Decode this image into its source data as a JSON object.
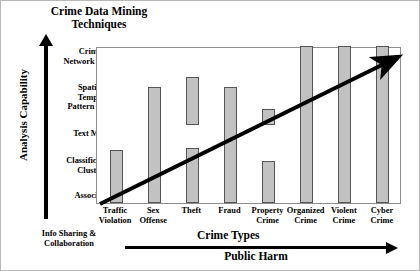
{
  "chart_data": {
    "type": "bar",
    "title": "Crime Data Mining Techniques",
    "title_line1": "Crime Data Mining",
    "title_line2": "Techniques",
    "xlabel": "Crime Types",
    "ylabel": "Analysis Capability",
    "secondary_xlabel": "Public Harm",
    "bottom_left_label": "Info Sharing & Collaboration",
    "grid": false,
    "legend": "none",
    "ylim": [
      0,
      5
    ],
    "ytick_labels": [
      "Association",
      "Classification & Clusterng",
      "Text Mining",
      "Spatial & Temporal Pattern Mining",
      "Criminal Network Analysis"
    ],
    "categories": [
      "Traffic Violation",
      "Sex Offense",
      "Theft",
      "Fraud",
      "Property Crime",
      "Organized Crime",
      "Violent Crime",
      "Cyber Crime"
    ],
    "values": [
      1.7,
      3.7,
      4.0,
      3.7,
      3.0,
      5.0,
      5.0,
      5.0
    ],
    "annotation": "Diagonal trend arrow rising from lower-left to upper-right",
    "bars": [
      {
        "label_line1": "Traffic",
        "label_line2": "Violation",
        "segments": [
          {
            "from": 0.0,
            "to": 1.7
          }
        ]
      },
      {
        "label_line1": "Sex",
        "label_line2": "Offense",
        "segments": [
          {
            "from": 0.0,
            "to": 3.7
          }
        ]
      },
      {
        "label_line1": "Theft",
        "label_line2": "",
        "segments": [
          {
            "from": 0.0,
            "to": 1.75
          },
          {
            "from": 2.5,
            "to": 4.0
          }
        ]
      },
      {
        "label_line1": "Fraud",
        "label_line2": "",
        "segments": [
          {
            "from": 0.0,
            "to": 3.7
          }
        ]
      },
      {
        "label_line1": "Property",
        "label_line2": "Crime",
        "segments": [
          {
            "from": 0.0,
            "to": 1.35
          },
          {
            "from": 2.5,
            "to": 3.0
          }
        ]
      },
      {
        "label_line1": "Organized",
        "label_line2": "Crime",
        "segments": [
          {
            "from": 0.0,
            "to": 5.0
          }
        ]
      },
      {
        "label_line1": "Violent",
        "label_line2": "Crime",
        "segments": [
          {
            "from": 0.0,
            "to": 5.0
          }
        ]
      },
      {
        "label_line1": "Cyber",
        "label_line2": "Crime",
        "segments": [
          {
            "from": 0.0,
            "to": 5.0
          }
        ]
      }
    ],
    "colors": {
      "bar_fill": "#c2c2c2",
      "bar_stroke": "#555555",
      "axis": "#000000",
      "frame": "#8d8d8d",
      "background": "#ffffff",
      "border": "#b9b9b9"
    }
  },
  "tiers": [
    {
      "label": "Criminal Network Analysis",
      "line1": "Criminal",
      "line2": "Network Analysis"
    },
    {
      "label": "Spatial & Temporal Pattern Mining",
      "line1": "Spatial &",
      "line2": "Temporal",
      "line3": "Pattern Mining"
    },
    {
      "label": "Text Mining",
      "line1": "Text Mining",
      "line2": ""
    },
    {
      "label": "Classification & Clusterng",
      "line1": "Classification &",
      "line2": "Clusterng"
    },
    {
      "label": "Association",
      "line1": "Association",
      "line2": ""
    }
  ]
}
